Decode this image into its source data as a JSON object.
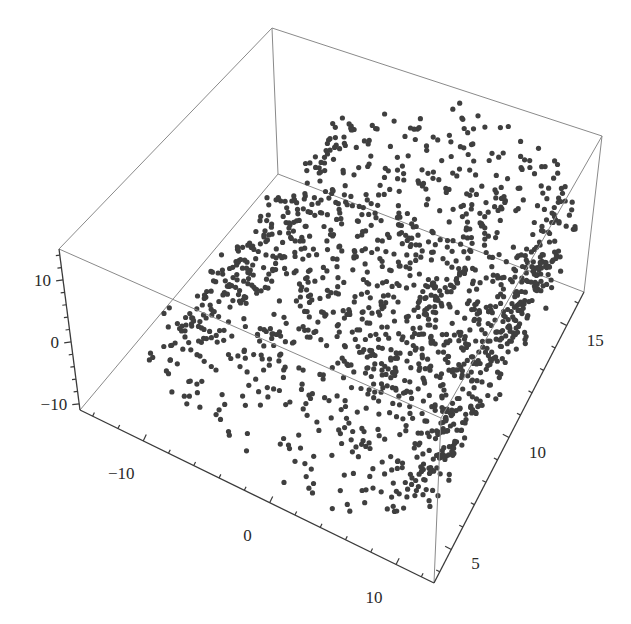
{
  "chart_data": {
    "type": "scatter3d",
    "title": "",
    "axes": {
      "x": {
        "label": "",
        "range": [
          -15,
          13
        ],
        "ticks": [
          -10,
          0,
          10
        ],
        "tick_labels": [
          "−10",
          "0",
          "10"
        ]
      },
      "y": {
        "label": "",
        "range": [
          3.5,
          16.5
        ],
        "ticks": [
          5,
          10,
          15
        ],
        "tick_labels": [
          "5",
          "10",
          "15"
        ]
      },
      "z": {
        "label": "",
        "range": [
          -11,
          15
        ],
        "ticks": [
          -10,
          0,
          10
        ],
        "tick_labels": [
          "−10",
          "0",
          "10"
        ]
      }
    },
    "series": [
      {
        "name": "points",
        "marker_color": "#3f3f3f",
        "marker_radius": 2.6,
        "generator": {
          "shape": "swiss-roll",
          "count": 1500,
          "t_range_radians": [
            4.712,
            14.137
          ],
          "x_formula": "t*cos(t)",
          "z_formula": "t*sin(t)",
          "y_range": [
            4,
            16
          ],
          "noise": 0.55,
          "seed": 7
        }
      }
    ],
    "box": true,
    "grid": false,
    "legend": null
  },
  "layout": {
    "corners_px": {
      "bottom_xmin_ymin": [
        80,
        410
      ],
      "bottom_xmax_ymin": [
        434,
        583
      ],
      "bottom_xmax_ymax": [
        584,
        292
      ],
      "bottom_xmin_ymax": [
        278,
        174
      ],
      "top_xmin_ymin": [
        59,
        249
      ],
      "top_xmax_ymin": [
        441,
        418
      ],
      "top_xmax_ymax": [
        602,
        136
      ],
      "top_xmin_ymax": [
        272,
        28
      ]
    },
    "colors": {
      "background": "#ffffff",
      "box_edge": "#8a8a8a",
      "axis": "#3a3a3a",
      "point": "#3f3f3f",
      "text": "#2a2a2a"
    }
  }
}
